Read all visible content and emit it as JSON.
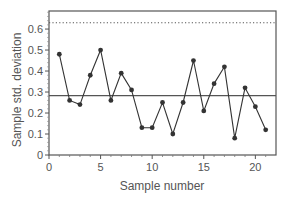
{
  "chart_data": {
    "type": "line",
    "title": "",
    "xlabel": "Sample number",
    "ylabel": "Sample std. deviation",
    "xlim": [
      0,
      22
    ],
    "ylim": [
      0,
      0.686
    ],
    "grid": false,
    "legend": null,
    "x_ticks": [
      0,
      5,
      10,
      15,
      20
    ],
    "x_tick_labels": [
      "0",
      "5",
      "10",
      "15",
      "20"
    ],
    "y_ticks": [
      0,
      0.1,
      0.2,
      0.3,
      0.4,
      0.5,
      0.6
    ],
    "y_tick_labels": [
      "0",
      "0.1",
      "0.2",
      "0.3",
      "0.4",
      "0.5",
      "0.6"
    ],
    "x": [
      1,
      2,
      3,
      4,
      5,
      6,
      7,
      8,
      9,
      10,
      11,
      12,
      13,
      14,
      15,
      16,
      17,
      18,
      19,
      20,
      21
    ],
    "series": [
      {
        "name": "Sample std. deviation",
        "values": [
          0.48,
          0.26,
          0.24,
          0.38,
          0.5,
          0.26,
          0.39,
          0.31,
          0.13,
          0.13,
          0.25,
          0.1,
          0.25,
          0.45,
          0.21,
          0.34,
          0.42,
          0.08,
          0.32,
          0.23,
          0.12
        ],
        "marker": "circle",
        "color": "#333333"
      }
    ],
    "reference_lines": [
      {
        "name": "center-line",
        "y": 0.283,
        "style": "solid",
        "color": "#555555"
      },
      {
        "name": "upper-control-limit",
        "y": 0.63,
        "style": "dotted",
        "color": "#555555"
      }
    ]
  }
}
